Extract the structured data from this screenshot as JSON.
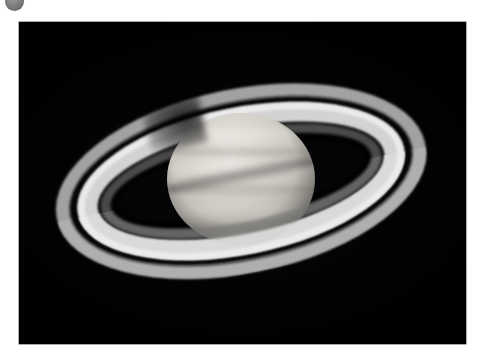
{
  "page": {
    "background_color": "#ffffff",
    "width": 484,
    "height": 361
  },
  "corner_control": {
    "name": "avatar-badge",
    "shape": "circle",
    "color": "#7e7e7e",
    "clipped": "top-left"
  },
  "photo": {
    "alt": "Telescopic photograph of the planet Saturn",
    "subject": "Saturn",
    "background_color": "#000000",
    "frame": {
      "x": 19,
      "y": 22,
      "width": 447,
      "height": 322
    },
    "features": {
      "globe_label": "Saturn globe",
      "rings_label": "Ring system",
      "cassini_label": "Cassini division",
      "a_ring_label": "A ring",
      "b_ring_label": "B ring",
      "c_ring_label": "C ring",
      "shadow_label": "Ring shadow on globe",
      "globe_shadow_label": "Globe shadow on rings"
    }
  },
  "chart_data": {
    "type": "image",
    "title": "Saturn"
  }
}
